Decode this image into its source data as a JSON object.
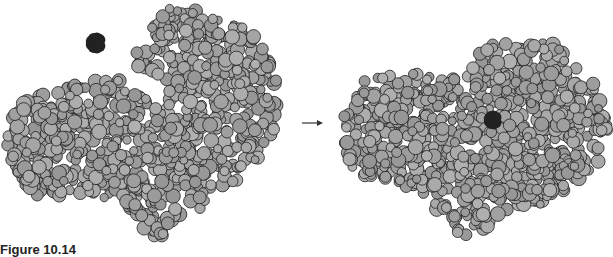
{
  "figure": {
    "caption": "Figure 10.14",
    "panels": [
      {
        "name": "enzyme-open",
        "state": "substrate unbound",
        "substrate_label": "substrate"
      },
      {
        "name": "enzyme-closed",
        "state": "substrate bound in active site",
        "substrate_label": "substrate"
      }
    ],
    "arrow": "right-arrow"
  },
  "colors": {
    "atom_fill": "#a6a6a6",
    "atom_stroke": "#1e1e1e",
    "substrate": "#222222",
    "arrow": "#333333",
    "background": "#ffffff"
  }
}
